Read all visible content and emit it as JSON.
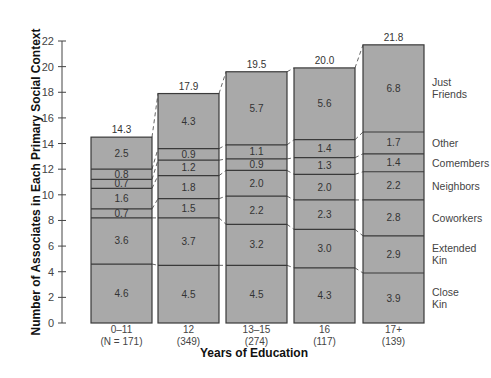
{
  "chart_data": {
    "type": "bar",
    "stacked": true,
    "title": "",
    "xlabel": "Years of Education",
    "ylabel": "Number of Associates in Each Primary Social Context",
    "ylim": [
      0,
      22
    ],
    "yticks": [
      0,
      2,
      4,
      6,
      8,
      10,
      12,
      14,
      16,
      18,
      20,
      22
    ],
    "grid": false,
    "legend_position": "right (inline labels beside last bar)",
    "categories": [
      "0–11",
      "12",
      "13–15",
      "16",
      "17+"
    ],
    "category_sublabels": [
      "(N = 171)",
      "(349)",
      "(274)",
      "(117)",
      "(139)"
    ],
    "totals": [
      14.3,
      17.9,
      19.5,
      20.0,
      21.8
    ],
    "series": [
      {
        "name": "Close Kin",
        "values": [
          4.6,
          4.5,
          4.5,
          4.3,
          3.9
        ]
      },
      {
        "name": "Extended Kin",
        "values": [
          3.6,
          3.7,
          3.2,
          3.0,
          2.9
        ]
      },
      {
        "name": "Coworkers",
        "values": [
          0.7,
          1.5,
          2.2,
          2.3,
          2.8
        ]
      },
      {
        "name": "Neighbors",
        "values": [
          1.6,
          1.8,
          2.0,
          2.0,
          2.2
        ]
      },
      {
        "name": "Comembers",
        "values": [
          0.7,
          1.2,
          0.9,
          1.3,
          1.4
        ]
      },
      {
        "name": "Other",
        "values": [
          0.8,
          0.9,
          1.1,
          1.4,
          1.7
        ]
      },
      {
        "name": "Just Friends",
        "values": [
          2.5,
          4.3,
          5.7,
          5.6,
          6.8
        ]
      }
    ],
    "legend_labels": [
      [
        "Close",
        "Kin"
      ],
      [
        "Extended",
        "Kin"
      ],
      [
        "Coworkers"
      ],
      [
        "Neighbors"
      ],
      [
        "Comembers"
      ],
      [
        "Other"
      ],
      [
        "Just",
        "Friends"
      ]
    ],
    "colors": {
      "bar_fill": "#a9a9a9",
      "bar_stroke": "#3a3a3a",
      "connector": "#555555",
      "axis": "#444444"
    }
  }
}
